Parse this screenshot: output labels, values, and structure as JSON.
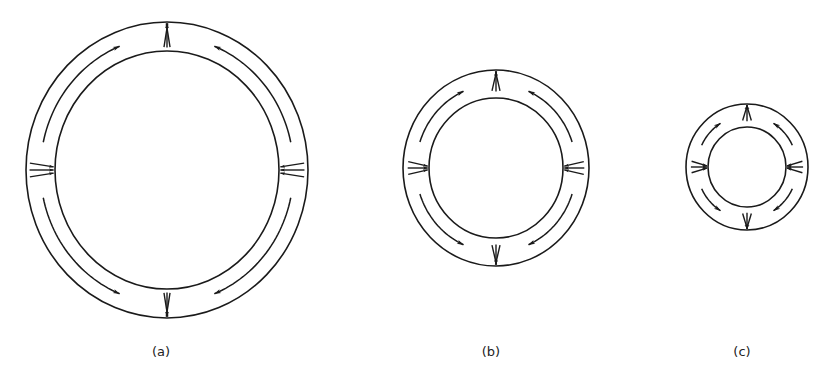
{
  "figure": {
    "width": 825,
    "height": 380,
    "stroke_color": "#1a1a1a",
    "background": "#ffffff",
    "panels": [
      {
        "id": "a",
        "label": "(a)",
        "label_pos": [
          161,
          356
        ],
        "center": [
          167,
          170
        ],
        "outer": [
          141,
          148
        ],
        "inner": [
          112,
          119
        ],
        "fan_len": 24,
        "fan_spread_deg": 9,
        "arc_arrows": [
          {
            "from_deg": 192,
            "to_deg": 248
          },
          {
            "from_deg": 348,
            "to_deg": 292
          },
          {
            "from_deg": 168,
            "to_deg": 112
          },
          {
            "from_deg": 12,
            "to_deg": 68
          }
        ]
      },
      {
        "id": "b",
        "label": "(b)",
        "label_pos": [
          491,
          356
        ],
        "center": [
          496,
          168
        ],
        "outer": [
          93,
          98
        ],
        "inner": [
          67,
          70
        ],
        "fan_len": 20,
        "fan_spread_deg": 13,
        "arc_arrows": [
          {
            "from_deg": 198,
            "to_deg": 246
          },
          {
            "from_deg": 342,
            "to_deg": 294
          },
          {
            "from_deg": 162,
            "to_deg": 114
          },
          {
            "from_deg": 18,
            "to_deg": 66
          }
        ]
      },
      {
        "id": "c",
        "label": "(c)",
        "label_pos": [
          742,
          356
        ],
        "center": [
          747,
          167
        ],
        "outer": [
          61,
          63
        ],
        "inner": [
          39,
          40
        ],
        "fan_len": 16,
        "fan_spread_deg": 17,
        "arc_arrows": [
          {
            "from_deg": 205,
            "to_deg": 238
          },
          {
            "from_deg": 335,
            "to_deg": 302
          },
          {
            "from_deg": 155,
            "to_deg": 122
          },
          {
            "from_deg": 25,
            "to_deg": 58
          }
        ]
      }
    ],
    "fan_groups": [
      {
        "position": "top",
        "angle_deg": 270,
        "direction": "outward"
      },
      {
        "position": "bottom",
        "angle_deg": 90,
        "direction": "outward"
      },
      {
        "position": "left",
        "angle_deg": 180,
        "direction": "inward"
      },
      {
        "position": "right",
        "angle_deg": 0,
        "direction": "inward"
      }
    ]
  }
}
